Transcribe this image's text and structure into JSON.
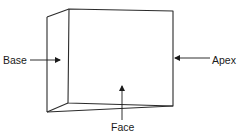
{
  "figure": {
    "type": "prism-diagram",
    "labels": {
      "base": "Base",
      "apex": "Apex",
      "face": "Face"
    },
    "colors": {
      "stroke": "#2b2b2b",
      "text": "#1a1a1a",
      "background": "#ffffff"
    }
  }
}
